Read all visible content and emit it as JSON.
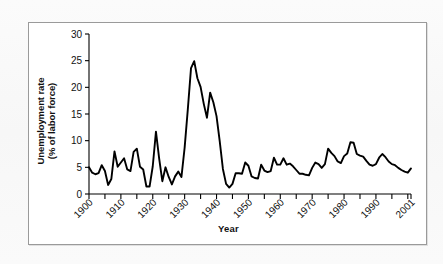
{
  "figure": {
    "frame_color": "#9a9a9a",
    "background": "#ffffff",
    "line_color": "#000000"
  },
  "chart_data": {
    "type": "line",
    "title": "",
    "xlabel": "Year",
    "ylabel": "Unemployment rate (% of labor force)",
    "ylabel_line1": "Unemployment rate",
    "ylabel_line2": "(% of labor force)",
    "xlim": [
      1900,
      2001
    ],
    "ylim": [
      0,
      30
    ],
    "yticks": [
      0,
      5,
      10,
      15,
      20,
      25,
      30
    ],
    "yticklabels": [
      "0",
      "5",
      "10",
      "15",
      "20",
      "25",
      "30"
    ],
    "xticks": [
      1900,
      1905,
      1910,
      1915,
      1920,
      1925,
      1930,
      1935,
      1940,
      1945,
      1950,
      1955,
      1960,
      1965,
      1970,
      1975,
      1980,
      1985,
      1990,
      1995,
      2000,
      2001
    ],
    "xticklabels_major": [
      "1900",
      "1910",
      "1920",
      "1930",
      "1940",
      "1950",
      "1960",
      "1970",
      "1980",
      "1990",
      "2001"
    ],
    "xticklabel_values": [
      1900,
      1910,
      1920,
      1930,
      1940,
      1950,
      1960,
      1970,
      1980,
      1990,
      2001
    ],
    "xticklabel_rotation": -45,
    "grid": false,
    "legend": false,
    "series": [
      {
        "name": "Unemployment rate",
        "color": "#000000",
        "x": [
          1900,
          1901,
          1902,
          1903,
          1904,
          1905,
          1906,
          1907,
          1908,
          1909,
          1910,
          1911,
          1912,
          1913,
          1914,
          1915,
          1916,
          1917,
          1918,
          1919,
          1920,
          1921,
          1922,
          1923,
          1924,
          1925,
          1926,
          1927,
          1928,
          1929,
          1930,
          1931,
          1932,
          1933,
          1934,
          1935,
          1936,
          1937,
          1938,
          1939,
          1940,
          1941,
          1942,
          1943,
          1944,
          1945,
          1946,
          1947,
          1948,
          1949,
          1950,
          1951,
          1952,
          1953,
          1954,
          1955,
          1956,
          1957,
          1958,
          1959,
          1960,
          1961,
          1962,
          1963,
          1964,
          1965,
          1966,
          1967,
          1968,
          1969,
          1970,
          1971,
          1972,
          1973,
          1974,
          1975,
          1976,
          1977,
          1978,
          1979,
          1980,
          1981,
          1982,
          1983,
          1984,
          1985,
          1986,
          1987,
          1988,
          1989,
          1990,
          1991,
          1992,
          1993,
          1994,
          1995,
          1996,
          1997,
          1998,
          1999,
          2000,
          2001
        ],
        "values": [
          5.0,
          4.0,
          3.7,
          3.9,
          5.4,
          4.3,
          1.7,
          2.8,
          8.0,
          5.1,
          5.9,
          6.7,
          4.6,
          4.3,
          7.9,
          8.5,
          5.1,
          4.6,
          1.4,
          1.4,
          5.2,
          11.7,
          6.7,
          2.4,
          5.0,
          3.2,
          1.8,
          3.3,
          4.2,
          3.2,
          8.7,
          15.9,
          23.6,
          24.9,
          21.7,
          20.1,
          16.9,
          14.3,
          19.0,
          17.2,
          14.6,
          9.9,
          4.7,
          1.9,
          1.2,
          1.9,
          3.9,
          3.9,
          3.8,
          5.9,
          5.3,
          3.3,
          3.0,
          2.9,
          5.5,
          4.4,
          4.1,
          4.3,
          6.8,
          5.5,
          5.5,
          6.7,
          5.5,
          5.7,
          5.2,
          4.5,
          3.8,
          3.8,
          3.6,
          3.5,
          4.9,
          5.9,
          5.6,
          4.9,
          5.6,
          8.5,
          7.7,
          7.1,
          6.1,
          5.8,
          7.1,
          7.6,
          9.7,
          9.6,
          7.5,
          7.2,
          7.0,
          6.2,
          5.5,
          5.3,
          5.6,
          6.8,
          7.5,
          6.9,
          6.1,
          5.6,
          5.4,
          4.9,
          4.5,
          4.2,
          4.0,
          4.8
        ]
      }
    ]
  },
  "axis_label_x": "Year"
}
